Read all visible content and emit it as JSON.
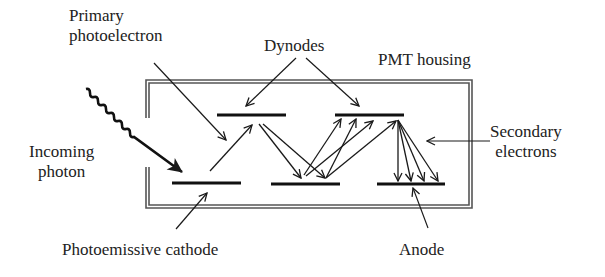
{
  "labels": {
    "primary_photoelectron_line1": "Primary",
    "primary_photoelectron_line2": "photoelectron",
    "dynodes": "Dynodes",
    "pmt_housing": "PMT housing",
    "secondary_electrons_line1": "Secondary",
    "secondary_electrons_line2": "electrons",
    "incoming_photon_line1": "Incoming",
    "incoming_photon_line2": "photon",
    "photoemissive_cathode": "Photoemissive cathode",
    "anode": "Anode"
  },
  "colors": {
    "line": "#1a1a1a",
    "housing": "#555555",
    "text": "#222222"
  }
}
